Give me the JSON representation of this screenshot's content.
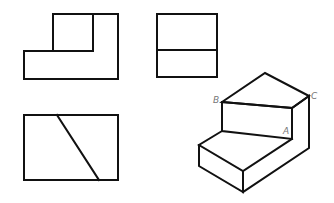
{
  "diagram": {
    "type": "orthographic-projection",
    "views": [
      {
        "name": "front-view"
      },
      {
        "name": "side-view"
      },
      {
        "name": "top-view"
      },
      {
        "name": "isometric-view"
      }
    ],
    "labels": {
      "a": "A",
      "b": "B",
      "c": "C"
    },
    "colors": {
      "line": "#111111",
      "label": "#777777",
      "background": "#ffffff"
    }
  }
}
